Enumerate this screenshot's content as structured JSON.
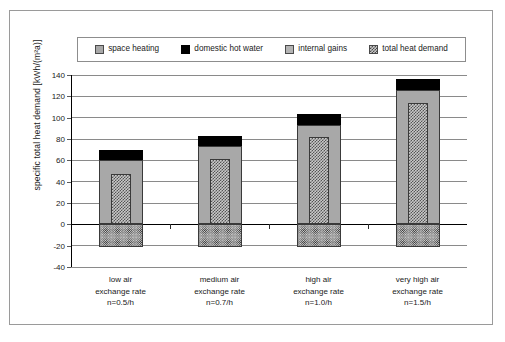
{
  "legend": {
    "items": [
      {
        "label": "space heating",
        "swatch": "space-heating-swatch",
        "color": "#a8a8a8"
      },
      {
        "label": "domestic hot water",
        "swatch": "domestic-hot-water-swatch",
        "color": "#000000"
      },
      {
        "label": "internal gains",
        "swatch": "internal-gains-swatch",
        "color": "#b0b0b0"
      },
      {
        "label": "total heat demand",
        "swatch": "total-heat-demand-swatch",
        "color": "#c9c9c9"
      }
    ]
  },
  "axes": {
    "y_title": "specific total heat demand [kWh/(m²a)]",
    "y_ticks": [
      "140",
      "120",
      "100",
      "80",
      "60",
      "40",
      "20",
      "0",
      "-20",
      "-40"
    ]
  },
  "x_labels": [
    {
      "line1": "low air",
      "line2": "exchange rate",
      "line3": "n=0.5/h"
    },
    {
      "line1": "medium air",
      "line2": "exchange rate",
      "line3": "n=0.7/h"
    },
    {
      "line1": "high air",
      "line2": "exchange rate",
      "line3": "n=1.0/h"
    },
    {
      "line1": "very high air",
      "line2": "exchange rate",
      "line3": "n=1.5/h"
    }
  ],
  "chart_data": {
    "type": "bar",
    "title": "",
    "xlabel": "",
    "ylabel": "specific total heat demand [kWh/(m²a)]",
    "ylim": [
      -40,
      140
    ],
    "ytick_step": 20,
    "grid": true,
    "legend_position": "top",
    "categories": [
      "low air exchange rate n=0.5/h",
      "medium air exchange rate n=0.7/h",
      "high air exchange rate n=1.0/h",
      "very high air exchange rate n=1.5/h"
    ],
    "series": [
      {
        "name": "space heating",
        "values": [
          60,
          73,
          93.5,
          125.5
        ]
      },
      {
        "name": "domestic hot water",
        "values": [
          9.5,
          10,
          9.5,
          10.5
        ]
      },
      {
        "name": "total heat demand",
        "values": [
          69.5,
          83,
          103,
          136
        ]
      },
      {
        "name": "internal gains",
        "values": [
          47,
          61,
          82,
          114
        ]
      },
      {
        "name": "internal gains (below zero)",
        "values": [
          -21,
          -21,
          -21,
          -21
        ]
      }
    ]
  }
}
